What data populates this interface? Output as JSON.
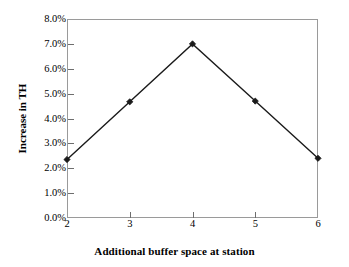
{
  "chart_data": {
    "type": "line",
    "title": "",
    "xlabel": "Additional buffer space at station",
    "ylabel": "Increase in TH",
    "x": [
      2,
      3,
      4,
      5,
      6
    ],
    "categories": [
      "2",
      "3",
      "4",
      "5",
      "6"
    ],
    "values": [
      0.0235,
      0.0467,
      0.07,
      0.047,
      0.024
    ],
    "series": [
      {
        "name": "Increase in TH",
        "values": [
          0.0235,
          0.0467,
          0.07,
          0.047,
          0.024
        ]
      }
    ],
    "xlim": [
      2,
      6
    ],
    "ylim": [
      0.0,
      0.08
    ],
    "ytick_values": [
      0.0,
      0.01,
      0.02,
      0.03,
      0.04,
      0.05,
      0.06,
      0.07,
      0.08
    ],
    "ytick_labels": [
      "0.0%",
      "1.0%",
      "2.0%",
      "3.0%",
      "4.0%",
      "5.0%",
      "6.0%",
      "7.0%",
      "8.0%"
    ],
    "xtick_values": [
      2,
      3,
      4,
      5,
      6
    ],
    "xtick_labels": [
      "2",
      "3",
      "4",
      "5",
      "6"
    ],
    "grid": false,
    "legend": null,
    "legend_position": "none",
    "marker": "diamond",
    "line_color": "#1a1a1a",
    "marker_color": "#1a1a1a",
    "frame_color": "#9a9a9a",
    "background_color": "#ffffff"
  }
}
